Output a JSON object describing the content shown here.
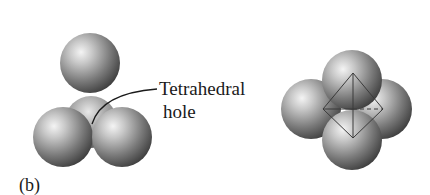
{
  "figure": {
    "panel_label": "(b)",
    "annotation": {
      "line1": "Tetrahedral",
      "line2": "hole"
    },
    "left_diagram": {
      "description": "Tetrahedral hole: one sphere above three close-packed spheres",
      "spheres": 4
    },
    "right_diagram": {
      "description": "Four spheres arranged around a tetrahedron outline",
      "spheres": 4
    },
    "colors": {
      "background": "#ffffff",
      "sphere_light": "#f2f2f2",
      "sphere_mid": "#9a9a9a",
      "sphere_dark": "#3c3c3c",
      "line": "#1a1a1a"
    }
  }
}
